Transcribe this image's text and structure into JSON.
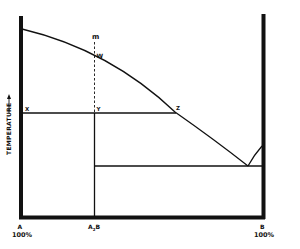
{
  "diagram": {
    "type": "phase-diagram",
    "y_axis_label": "TEMPERATURE",
    "y_axis_arrow": "→",
    "bottom_labels": {
      "left": {
        "component": "A",
        "percent": "100%"
      },
      "middle": "A₂B",
      "right": {
        "component": "B",
        "percent": "100%"
      }
    },
    "points": {
      "m": "m",
      "w": "W",
      "x": "X",
      "y": "Y",
      "z": "Z"
    },
    "colors": {
      "ink": "#111111",
      "background": "#ffffff"
    }
  }
}
